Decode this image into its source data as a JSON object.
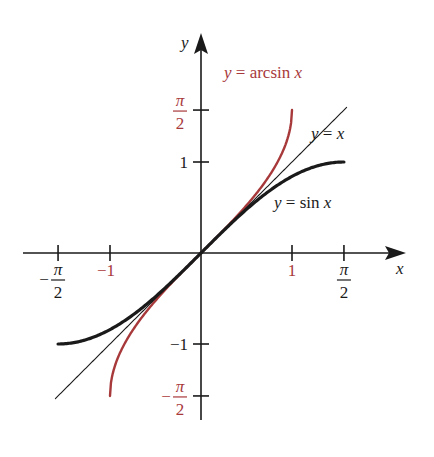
{
  "chart_data": {
    "type": "line",
    "title": "",
    "xlabel": "x",
    "ylabel": "y",
    "xlim": [
      -1.95,
      2.25
    ],
    "ylim": [
      -1.85,
      2.4
    ],
    "grid": false,
    "legend": "none (curves labelled inline)",
    "series": [
      {
        "name": "y = arcsin x",
        "function": "arcsin",
        "domain": [
          -1,
          1
        ],
        "color": "#a8393b",
        "label_position": "top-right of curve end"
      },
      {
        "name": "y = x",
        "function": "identity",
        "domain": [
          -1.6,
          1.6
        ],
        "color": "#1a1a1a",
        "label_position": "upper-right"
      },
      {
        "name": "y = sin x",
        "function": "sin",
        "domain": [
          -1.5708,
          1.5708
        ],
        "color": "#1a1a1a",
        "label_position": "below curve, right"
      }
    ],
    "x_ticks": [
      {
        "value": -1.5708,
        "label_num": "π",
        "label_den": "2",
        "label_sign": "−",
        "color": "#1a1a1a"
      },
      {
        "value": -1,
        "label": "−1",
        "color": "#a8393b"
      },
      {
        "value": 1,
        "label": "1",
        "color": "#a8393b"
      },
      {
        "value": 1.5708,
        "label_num": "π",
        "label_den": "2",
        "label_sign": "",
        "color": "#1a1a1a"
      }
    ],
    "y_ticks": [
      {
        "value": 1.5708,
        "label_num": "π",
        "label_den": "2",
        "label_sign": "",
        "color": "#a8393b"
      },
      {
        "value": 1,
        "label": "1",
        "color": "#1a1a1a"
      },
      {
        "value": -1,
        "label": "−1",
        "color": "#1a1a1a"
      },
      {
        "value": -1.5708,
        "label_num": "π",
        "label_den": "2",
        "label_sign": "−",
        "color": "#a8393b"
      }
    ],
    "annotations": [
      {
        "text_pre": "y",
        "text_eq": " = ",
        "text_fn": "arcsin ",
        "text_var": "x",
        "series": "y = arcsin x",
        "color": "#a8393b"
      },
      {
        "text_pre": "y",
        "text_eq": " = ",
        "text_fn": "",
        "text_var": "x",
        "series": "y = x",
        "color": "#1a1a1a"
      },
      {
        "text_pre": "y",
        "text_eq": " = ",
        "text_fn": "sin ",
        "text_var": "x",
        "series": "y = sin x",
        "color": "#1a1a1a"
      }
    ]
  }
}
